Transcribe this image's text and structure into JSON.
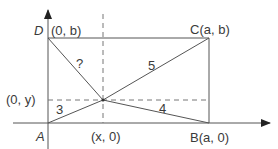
{
  "diagram": {
    "type": "coordinate-geometry-rectangle",
    "colors": {
      "line": "#555555",
      "dashed": "#777777",
      "text": "#3a3a3a",
      "background": "#ffffff"
    },
    "points": {
      "D": {
        "name": "D",
        "coord": "(0, b)"
      },
      "C": {
        "name": "C",
        "coord": "(a, b)"
      },
      "A": {
        "name": "A",
        "coord": ""
      },
      "B": {
        "name": "B",
        "coord": "(a, 0)"
      }
    },
    "labels": {
      "D_letter": "D",
      "D_coord": "(0, b)",
      "C_label": "C(a, b)",
      "A_letter": "A",
      "B_label": "B(a, 0)",
      "y_proj": "(0, y)",
      "x_proj": "(x, 0)"
    },
    "segment_lengths": {
      "PD": "?",
      "PC": "5",
      "PA": "3",
      "PB": "4"
    }
  }
}
